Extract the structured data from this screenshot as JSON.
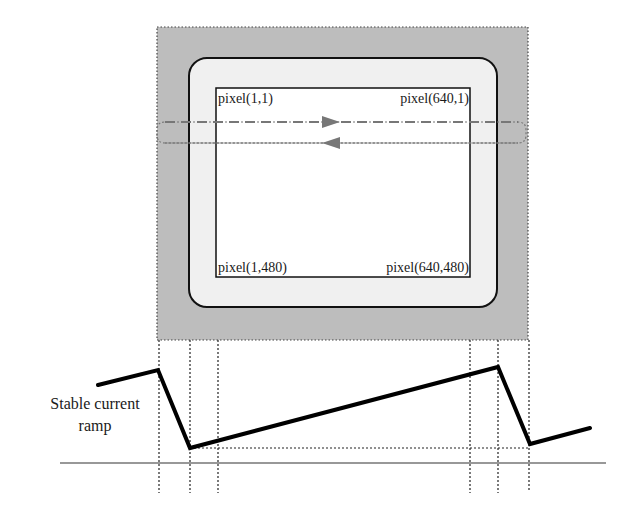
{
  "diagram": {
    "type": "raster-scan-timing",
    "screen": {
      "corner_labels": {
        "top_left": "pixel(1,1)",
        "top_right": "pixel(640,1)",
        "bottom_left": "pixel(1,480)",
        "bottom_right": "pixel(640,480)"
      },
      "scan_line": {
        "style": "dashed",
        "direction": "right"
      },
      "retrace_line": {
        "style": "dotted",
        "direction": "left"
      }
    },
    "waveform": {
      "label_line1": "Stable current",
      "label_line2": "ramp",
      "points": [
        [
          98,
          385
        ],
        [
          158,
          370
        ],
        [
          190,
          448
        ],
        [
          498,
          367
        ],
        [
          530,
          444
        ],
        [
          590,
          428
        ]
      ]
    },
    "colors": {
      "outer_region": "#bdbdbd",
      "bezel": "#f0f0f0",
      "screen": "#ffffff",
      "line": "#111111",
      "scan": "#666666"
    }
  }
}
